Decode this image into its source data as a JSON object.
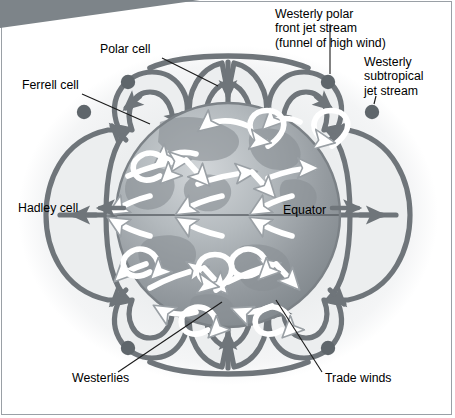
{
  "figure": {
    "type": "diagram"
  },
  "labels": {
    "polar_cell": "Polar cell",
    "ferrell_cell": "Ferrell cell",
    "hadley_cell": "Hadley cell",
    "equator": "Equator",
    "polar_jet": "Westerly polar\nfront jet stream\n(funnel of high wind)",
    "subtropical_jet": "Westerly\nsubtropical\njet stream",
    "westerlies": "Westerlies",
    "trade_winds": "Trade winds"
  },
  "colors": {
    "cell_stroke": "#6f757a",
    "cell_fill": "#eceeef",
    "jet_dot": "#5f666b",
    "globe_dark": "#8e9499",
    "globe_light": "#c3c8cb",
    "halo": "#f0f1f2",
    "wind_arrow": "#ffffff",
    "wind_arrow_edge": "#9aa0a5",
    "banner": "#7d8489",
    "frame_border": "#9aa0a6",
    "leader_line": "#1a1a1a",
    "text": "#000000"
  },
  "icons": {
    "jet_dot": "jet-stream-marker-dot",
    "arrow": "flow-direction-arrow"
  }
}
